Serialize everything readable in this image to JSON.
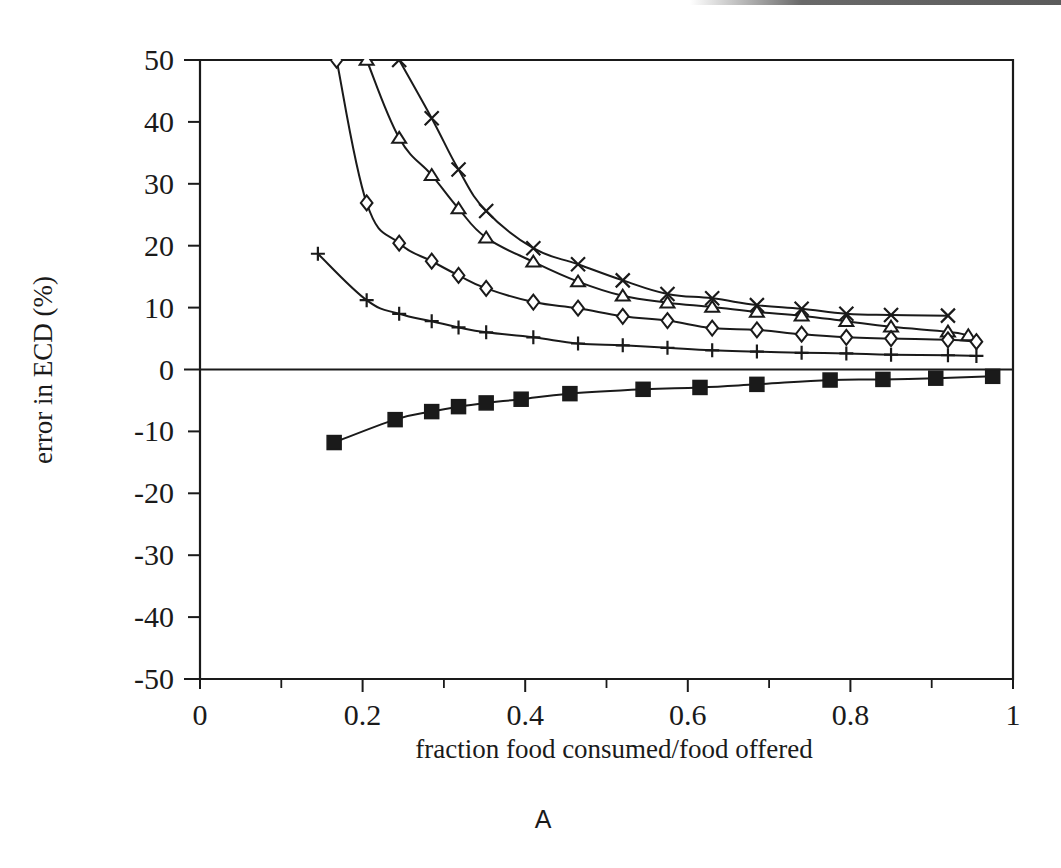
{
  "figure": {
    "panel_label": "A",
    "background_color": "#ffffff",
    "ink_color": "#1a1a1a"
  },
  "chart_data": {
    "type": "line",
    "title": "",
    "subtitle": "",
    "xlabel": "fraction food consumed/food offered",
    "ylabel": "error in ECD (%)",
    "xlim": [
      0,
      1
    ],
    "ylim": [
      -50,
      50
    ],
    "xticks": [
      0,
      0.2,
      0.4,
      0.6,
      0.8,
      1
    ],
    "xtick_labels": [
      "0",
      "0.2",
      "0.4",
      "0.6",
      "0.8",
      "1"
    ],
    "xticks_minor": [
      0.1,
      0.3,
      0.5,
      0.7,
      0.9
    ],
    "yticks": [
      50,
      40,
      30,
      20,
      10,
      0,
      -10,
      -20,
      -30,
      -40,
      -50
    ],
    "ytick_labels": [
      "50",
      "40",
      "30",
      "20",
      "10",
      "0",
      "-10",
      "-20",
      "-30",
      "-40",
      "-50"
    ],
    "grid": false,
    "legend": "none",
    "zero_line": true,
    "annotations": [
      {
        "text": "A",
        "position": "below-axis-centered"
      }
    ],
    "series": [
      {
        "name": "cross-series",
        "marker": "x",
        "marker_label": "×",
        "x": [
          0.245,
          0.285,
          0.318,
          0.352,
          0.41,
          0.465,
          0.52,
          0.575,
          0.63,
          0.685,
          0.74,
          0.795,
          0.85,
          0.92
        ],
        "y": [
          50.0,
          40.6,
          32.3,
          25.6,
          19.6,
          17.0,
          14.4,
          12.2,
          11.5,
          10.4,
          9.8,
          9.0,
          8.8,
          8.7
        ]
      },
      {
        "name": "triangle-series",
        "marker": "triangle-up",
        "marker_label": "△",
        "x": [
          0.205,
          0.245,
          0.285,
          0.318,
          0.352,
          0.41,
          0.465,
          0.52,
          0.575,
          0.63,
          0.685,
          0.74,
          0.795,
          0.85,
          0.92,
          0.945
        ],
        "y": [
          50.0,
          37.4,
          31.4,
          26.0,
          21.3,
          17.4,
          14.2,
          11.9,
          10.8,
          10.1,
          9.3,
          8.7,
          7.8,
          6.9,
          6.1,
          5.5
        ]
      },
      {
        "name": "diamond-series",
        "marker": "diamond",
        "marker_label": "◇",
        "x": [
          0.168,
          0.205,
          0.245,
          0.285,
          0.318,
          0.352,
          0.41,
          0.465,
          0.52,
          0.575,
          0.63,
          0.685,
          0.74,
          0.795,
          0.85,
          0.92,
          0.955
        ],
        "y": [
          50.0,
          26.9,
          20.4,
          17.5,
          15.2,
          13.1,
          10.9,
          9.9,
          8.6,
          7.9,
          6.7,
          6.4,
          5.7,
          5.2,
          5.0,
          4.8,
          4.5
        ]
      },
      {
        "name": "plus-series",
        "marker": "plus",
        "marker_label": "+",
        "x": [
          0.145,
          0.205,
          0.245,
          0.285,
          0.318,
          0.352,
          0.41,
          0.465,
          0.52,
          0.575,
          0.63,
          0.685,
          0.74,
          0.795,
          0.85,
          0.92,
          0.955
        ],
        "y": [
          18.7,
          11.2,
          9.0,
          7.8,
          6.8,
          6.0,
          5.2,
          4.2,
          3.9,
          3.5,
          3.1,
          2.9,
          2.7,
          2.6,
          2.4,
          2.3,
          2.2
        ]
      },
      {
        "name": "filled-square-series",
        "marker": "square-filled",
        "marker_label": "■",
        "x": [
          0.165,
          0.24,
          0.285,
          0.318,
          0.352,
          0.395,
          0.455,
          0.545,
          0.615,
          0.685,
          0.775,
          0.84,
          0.905,
          0.975
        ],
        "y": [
          -11.8,
          -8.1,
          -6.8,
          -6.0,
          -5.4,
          -4.8,
          -3.9,
          -3.2,
          -2.9,
          -2.4,
          -1.7,
          -1.6,
          -1.4,
          -1.1
        ]
      }
    ]
  }
}
